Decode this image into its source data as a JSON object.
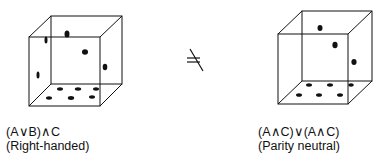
{
  "figure": {
    "left": {
      "formula": "(A∨B)∧C",
      "label": "(Right-handed)"
    },
    "relation_symbol": "≠",
    "right": {
      "formula": "(A∧C)∨(A∧C)",
      "label": "(Parity neutral)"
    }
  },
  "colors": {
    "ink": "#111111",
    "background": "#ffffff"
  }
}
